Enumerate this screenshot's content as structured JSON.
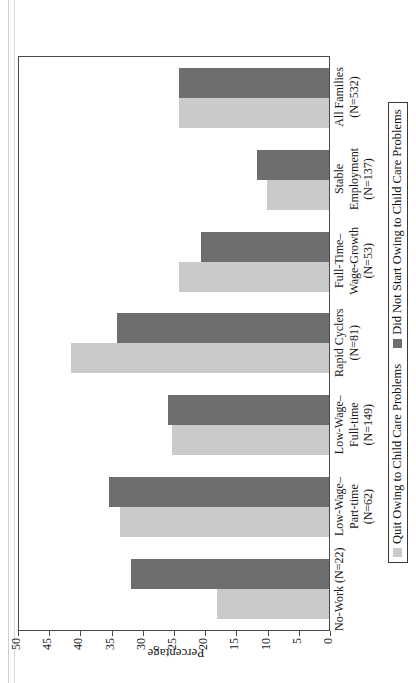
{
  "chart_data": {
    "type": "bar",
    "title": "",
    "xlabel": "",
    "ylabel": "Percentage",
    "ylim": [
      0,
      50
    ],
    "yticks": [
      "0",
      "5",
      "10",
      "15",
      "20",
      "25",
      "30",
      "35",
      "40",
      "45",
      "50"
    ],
    "grid": false,
    "legend_position": "bottom",
    "categories": [
      "No-Work (N=22)",
      "Low-Wage–\nPart-time\n(N=62)",
      "Low-Wage–\nFull-time\n(N=149)",
      "Rapid Cyclers\n(N=81)",
      "Full-Time–\nWage-Growth\n(N=53)",
      "Stable\nEmployment\n(N=137)",
      "All Families\n(N=532)"
    ],
    "category_lines": [
      [
        "No-Work (N=22)"
      ],
      [
        "Low-Wage–",
        "Part-time",
        "(N=62)"
      ],
      [
        "Low-Wage–",
        "Full-time",
        "(N=149)"
      ],
      [
        "Rapid Cyclers",
        "(N=81)"
      ],
      [
        "Full-Time–",
        "Wage-Growth",
        "(N=53)"
      ],
      [
        "Stable",
        "Employment",
        "(N=137)"
      ],
      [
        "All Families",
        "(N=532)"
      ]
    ],
    "series": [
      {
        "name": "Quit Owing to Child Care Problems",
        "color": "#cacaca",
        "values": [
          18.0,
          33.5,
          25.2,
          41.3,
          24.0,
          10.0,
          24.0
        ]
      },
      {
        "name": "Did Not Start Owing to Child Care Problems",
        "color": "#6e6e6e",
        "values": [
          31.7,
          35.3,
          25.8,
          34.0,
          20.5,
          11.5,
          24.0
        ]
      }
    ]
  },
  "legend": {
    "items": [
      {
        "label": "Quit Owing to Child Care Problems",
        "swatch": "light"
      },
      {
        "label": "Did Not Start Owing to Child Care Problems",
        "swatch": "dark"
      }
    ]
  }
}
